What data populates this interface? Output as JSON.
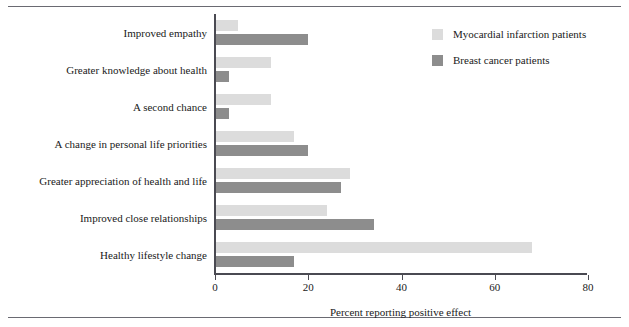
{
  "chart_data": {
    "type": "bar",
    "orientation": "horizontal",
    "title": "",
    "xlabel": "Percent reporting positive effect",
    "ylabel": "",
    "xlim": [
      0,
      80
    ],
    "xticks": [
      0,
      20,
      40,
      60,
      80
    ],
    "grid": false,
    "legend_position": "upper-right",
    "categories": [
      "Improved empathy",
      "Greater knowledge about health",
      "A second chance",
      "A change in personal life priorities",
      "Greater appreciation of health and life",
      "Improved close relationships",
      "Healthy lifestyle change"
    ],
    "series": [
      {
        "name": "Myocardial infarction patients",
        "color": "#dcdcdc",
        "values": [
          5,
          12,
          12,
          17,
          29,
          24,
          68
        ]
      },
      {
        "name": "Breast cancer patients",
        "color": "#8d8d8d",
        "values": [
          20,
          3,
          3,
          20,
          27,
          34,
          17
        ]
      }
    ]
  },
  "axis": {
    "tick_labels": [
      "0",
      "20",
      "40",
      "60",
      "80"
    ],
    "x_title": "Percent reporting positive effect"
  },
  "legend": {
    "items": [
      {
        "label": "Myocardial infarction patients",
        "color": "#dcdcdc"
      },
      {
        "label": "Breast cancer patients",
        "color": "#8d8d8d"
      }
    ]
  },
  "colors": {
    "series_light": "#dcdcdc",
    "series_dark": "#8d8d8d",
    "axis": "#4a4a52",
    "rule": "#6a6a72",
    "text": "#1a1a1a"
  }
}
